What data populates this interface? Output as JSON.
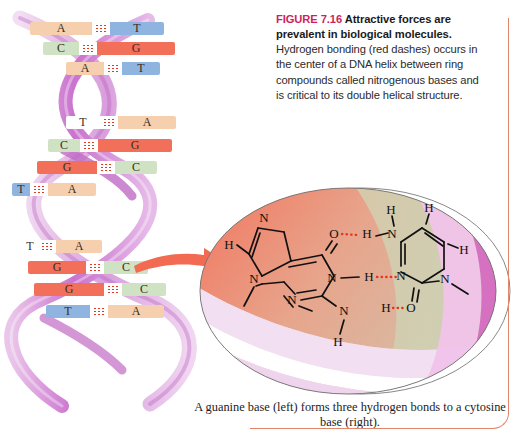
{
  "figure": {
    "number_label": "FIGURE 7.16",
    "title": "Attractive forces are prevalent in biological molecules.",
    "body": "Hydrogen bonding (red dashes) occurs in the center of a DNA helix between ring compounds called nitrogenous bases and is critical to its double helical structure.",
    "number_color": "#cf1f5e",
    "rule_color": "#e0876b"
  },
  "dna": {
    "base_pairs": [
      {
        "left": "A",
        "right": "T"
      },
      {
        "left": "C",
        "right": "G"
      },
      {
        "left": "A",
        "right": "T"
      },
      {
        "left": "T",
        "right": "A"
      },
      {
        "left": "C",
        "right": "G"
      },
      {
        "left": "G",
        "right": "C"
      },
      {
        "left": "T",
        "right": "A"
      },
      {
        "left": "T",
        "right": "A"
      },
      {
        "left": "G",
        "right": "C"
      },
      {
        "left": "G",
        "right": "C"
      },
      {
        "left": "T",
        "right": "A"
      }
    ],
    "base_colors": {
      "A": "#f6cfae",
      "T": "#8fb4e0",
      "G": "#f2705a",
      "C": "#cfe3c4"
    },
    "backbone_colors": [
      "#d9a6dd",
      "#c06bc4",
      "#efcdee"
    ],
    "hydrogen_bond_color": "#e23b22"
  },
  "detail_circle": {
    "caption": "A guanine base (left) forms three hydrogen bonds to a cytosine base (right).",
    "guanine_label": "guanine",
    "cytosine_label": "cytosine",
    "hydrogen_bond_count": 3,
    "atoms": [
      {
        "text": "H",
        "x": 33,
        "y": 61
      },
      {
        "text": "N",
        "x": 68,
        "y": 34
      },
      {
        "text": "N",
        "x": 58,
        "y": 95
      },
      {
        "text": "N",
        "x": 96,
        "y": 116
      },
      {
        "text": "N",
        "x": 136,
        "y": 94
      },
      {
        "text": "O",
        "x": 138,
        "y": 50
      },
      {
        "text": "N",
        "x": 148,
        "y": 127
      },
      {
        "text": "H",
        "x": 142,
        "y": 158
      },
      {
        "text": "H",
        "x": 168,
        "y": 56
      },
      {
        "text": "H",
        "x": 175,
        "y": 93
      },
      {
        "text": "H",
        "x": 190,
        "y": 125
      },
      {
        "text": "N",
        "x": 198,
        "y": 50
      },
      {
        "text": "H",
        "x": 195,
        "y": 26
      },
      {
        "text": "N",
        "x": 213,
        "y": 92
      },
      {
        "text": "O",
        "x": 215,
        "y": 124
      },
      {
        "text": "H",
        "x": 233,
        "y": 38
      },
      {
        "text": "H",
        "x": 268,
        "y": 66
      },
      {
        "text": "N",
        "x": 249,
        "y": 95
      }
    ]
  }
}
